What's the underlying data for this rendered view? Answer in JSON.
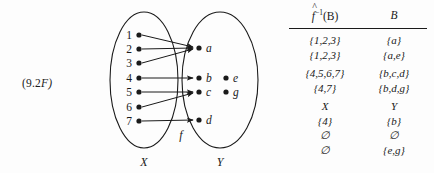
{
  "figure": {
    "label_prefix": "(9.2",
    "label_suffix": "F)",
    "function_label": "f",
    "domain_label": "X",
    "codomain_label": "Y"
  },
  "diagram": {
    "domain_elements": [
      "1",
      "2",
      "3",
      "4",
      "5",
      "6",
      "7"
    ],
    "codomain_elements": [
      "a",
      "b",
      "c",
      "d",
      "e",
      "g"
    ],
    "mapped_codomain": [
      "a",
      "b",
      "c",
      "d"
    ],
    "unmapped_codomain": [
      "e",
      "g"
    ],
    "arrows": [
      {
        "from": "1",
        "to": "a"
      },
      {
        "from": "2",
        "to": "a"
      },
      {
        "from": "3",
        "to": "a"
      },
      {
        "from": "4",
        "to": "b"
      },
      {
        "from": "5",
        "to": "c"
      },
      {
        "from": "6",
        "to": "c"
      },
      {
        "from": "7",
        "to": "d"
      }
    ]
  },
  "table": {
    "headers": {
      "preimage_f": "f",
      "preimage_hat": "^",
      "preimage_exp": "−1",
      "preimage_arg": "(B)",
      "set_b": "B"
    },
    "rows": [
      {
        "preimage": "{1,2,3}",
        "set_b": "{a}"
      },
      {
        "preimage": "{1,2,3}",
        "set_b": "{a,e}"
      },
      {
        "preimage": "{4,5,6,7}",
        "set_b": "{b,c,d}"
      },
      {
        "preimage": "{4,7}",
        "set_b": "{b,d,g}"
      },
      {
        "preimage": "X",
        "set_b": "Y"
      },
      {
        "preimage": "{4}",
        "set_b": "{b}"
      },
      {
        "preimage": "∅",
        "set_b": "∅"
      },
      {
        "preimage": "∅",
        "set_b": "{e,g}"
      }
    ]
  },
  "colors": {
    "ink": "#1a1a1a",
    "background": "#fdfdfd"
  }
}
